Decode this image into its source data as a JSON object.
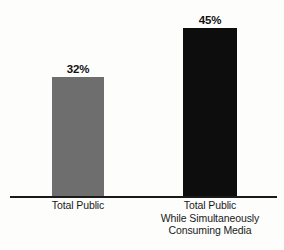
{
  "chart_data": {
    "type": "bar",
    "title": "",
    "subtitle": "",
    "xlabel": "",
    "ylabel": "",
    "ylim": [
      0,
      50
    ],
    "grid": false,
    "legend": false,
    "categories": [
      "Total Public",
      "Total Public While Simultaneously Consuming Media"
    ],
    "category_lines": [
      [
        "Total Public"
      ],
      [
        "Total Public",
        "While Simultaneously",
        "Consuming Media"
      ]
    ],
    "values": [
      32,
      45
    ],
    "value_labels": [
      "32%",
      "45%"
    ],
    "bar_colors": [
      "#6e6e6e",
      "#0d0d0d"
    ],
    "axis_color": "#1a1a1a",
    "background_color": "#fdfdfc"
  },
  "bars": [
    {
      "label": "Total Public",
      "value_label": "32%",
      "lines": [
        "Total Public"
      ]
    },
    {
      "label": "Total Public While Simultaneously Consuming Media",
      "value_label": "45%",
      "lines": [
        "Total Public",
        "While Simultaneously",
        "Consuming Media"
      ]
    }
  ]
}
